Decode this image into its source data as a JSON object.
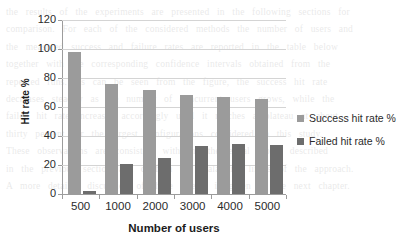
{
  "chart_data": {
    "type": "bar",
    "title": "",
    "xlabel": "Number of users",
    "ylabel": "Hit rate %",
    "categories": [
      "500",
      "1000",
      "2000",
      "3000",
      "4000",
      "5000"
    ],
    "series": [
      {
        "name": "Success hit rate %",
        "color": "#9b9b9b",
        "values": [
          98,
          76,
          72,
          68.5,
          67,
          65.5
        ]
      },
      {
        "name": "Failed hit rate %",
        "color": "#6d6d6d",
        "values": [
          2,
          21,
          25,
          33,
          34.5,
          33.5
        ]
      }
    ],
    "ylim": [
      0,
      120
    ],
    "yticks": [
      0,
      20,
      40,
      60,
      80,
      100,
      120
    ],
    "ytick_labels": [
      "0",
      "20",
      "40",
      "60",
      "80",
      "100",
      "120"
    ],
    "grid": true,
    "grid_axis": "y",
    "legend_position": "right"
  },
  "legend": {
    "entries": [
      {
        "label": "Success hit rate %",
        "color": "#9b9b9b"
      },
      {
        "label": "Failed hit rate %",
        "color": "#6d6d6d"
      }
    ]
  },
  "background_text": {
    "line1": "the results of the experiments are presented in the following sections for",
    "line2": "comparison. For each of the considered methods the number of users and",
    "line3": "the measured success and failure rates are reported in the table below",
    "line4": "together with the corresponding confidence intervals obtained from the",
    "line5": "repeated runs. As can be seen from the figure, the success hit rate",
    "line6": "decreases steadily as the number of concurrent users grows, while the",
    "line7": "failed hit rate increases accordingly until it reaches a plateau at about",
    "line8": "thirty percent for the largest configurations considered in this study.",
    "line9": "These observations are consistent with the theoretical model described",
    "line10": "in the previous section and confirm the scalability limits of the approach.",
    "line11": "A more detailed discussion of these effects is given in the next chapter."
  }
}
